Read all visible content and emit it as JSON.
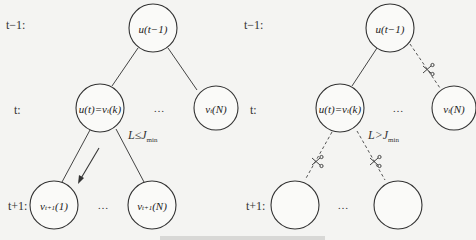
{
  "left_panel": {
    "row_labels": {
      "t_minus_1": "t−1:",
      "t": "t:",
      "t_plus_1": "t+1:"
    },
    "root": {
      "label": "u(t−1)"
    },
    "level_t": {
      "chosen": {
        "main": "u(t)=v",
        "sub": "t",
        "arg": "(k)"
      },
      "other": {
        "main": "v",
        "sub": "t",
        "arg": "(N)"
      },
      "ellipsis": "…"
    },
    "condition": {
      "lhs": "L≤J",
      "sub": "min"
    },
    "level_t_plus_1": {
      "first": {
        "main": "v",
        "sub": "t+1",
        "arg": "(1)"
      },
      "last": {
        "main": "v",
        "sub": "t+1",
        "arg": "(N)"
      },
      "ellipsis": "…"
    },
    "edges": {
      "root_to_children": "solid",
      "chosen_to_children": "solid",
      "expand_arrow": true
    }
  },
  "right_panel": {
    "row_labels": {
      "t_minus_1": "t−1:",
      "t": "t:",
      "t_plus_1": "t+1:"
    },
    "root": {
      "label": "u(t−1)"
    },
    "level_t": {
      "chosen": {
        "main": "u(t)=v",
        "sub": "t",
        "arg": "(k)"
      },
      "other": {
        "main": "v",
        "sub": "t",
        "arg": "(N)"
      },
      "ellipsis": "…"
    },
    "condition": {
      "lhs": "L>J",
      "sub": "min"
    },
    "level_t_plus_1": {
      "first": {
        "label": ""
      },
      "last": {
        "label": ""
      },
      "ellipsis": "…"
    },
    "edges": {
      "root_to_other": "pruned",
      "chosen_to_children": "pruned"
    },
    "icons": [
      "scissors-icon",
      "scissors-icon",
      "scissors-icon"
    ]
  },
  "caption": {
    "text": ""
  },
  "colors": {
    "stroke": "#333333",
    "background": "#f4f4f2",
    "node_fill": "#fafaf8"
  }
}
